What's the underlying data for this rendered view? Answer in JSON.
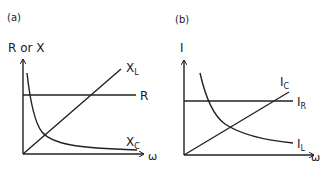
{
  "panels": [
    {
      "id": "a",
      "label": "(a)",
      "y_axis_label": "R or X",
      "x_axis_label": "ω",
      "curves": [
        {
          "name": "X_L",
          "main": "X",
          "sub": "L",
          "shape": "linear-increasing"
        },
        {
          "name": "R",
          "main": "R",
          "sub": "",
          "shape": "constant"
        },
        {
          "name": "X_C",
          "main": "X",
          "sub": "C",
          "shape": "inverse-decreasing"
        }
      ]
    },
    {
      "id": "b",
      "label": "(b)",
      "y_axis_label": "I",
      "x_axis_label": "ω",
      "curves": [
        {
          "name": "I_C",
          "main": "I",
          "sub": "C",
          "shape": "linear-increasing"
        },
        {
          "name": "I_R",
          "main": "I",
          "sub": "R",
          "shape": "constant"
        },
        {
          "name": "I_L",
          "main": "I",
          "sub": "L",
          "shape": "inverse-decreasing"
        }
      ]
    }
  ],
  "colors": {
    "stroke": "#222222",
    "background": "#ffffff"
  }
}
